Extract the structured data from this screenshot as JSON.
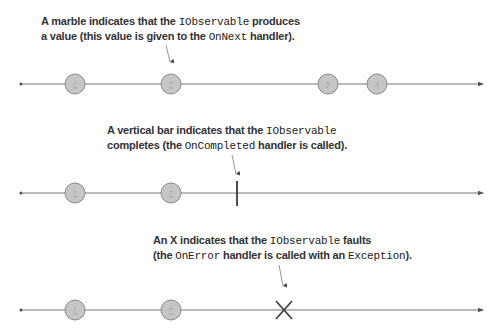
{
  "diagrams": [
    {
      "caption": {
        "line1": [
          "A marble indicates that the ",
          "IObservable",
          " produces"
        ],
        "line2": [
          "a value (this value is given to the ",
          "OnNext",
          " handler)."
        ]
      },
      "marbles": [
        {
          "label": "1",
          "x": 75
        },
        {
          "label": "2",
          "x": 171
        },
        {
          "label": "3",
          "x": 328
        },
        {
          "label": "4",
          "x": 377
        }
      ],
      "terminator": "none"
    },
    {
      "caption": {
        "line1": [
          "A vertical bar indicates that the ",
          "IObservable",
          ""
        ],
        "line2": [
          "completes (the ",
          "OnCompleted",
          " handler is called)."
        ]
      },
      "marbles": [
        {
          "label": "1",
          "x": 75
        },
        {
          "label": "2",
          "x": 171
        }
      ],
      "terminator": "completed-bar"
    },
    {
      "caption": {
        "line1": [
          "An X indicates that the ",
          "IObservable",
          " faults"
        ],
        "line2": [
          "(the ",
          "OnError",
          " handler is called with an ",
          "Exception",
          ")."
        ]
      },
      "marbles": [
        {
          "label": "1",
          "x": 75
        },
        {
          "label": "2",
          "x": 171
        }
      ],
      "terminator": "error-x"
    }
  ],
  "colors": {
    "marble_fill": "#c6c6c6",
    "marble_stroke": "#8a8a8a",
    "line": "#666666",
    "text": "#333333"
  }
}
